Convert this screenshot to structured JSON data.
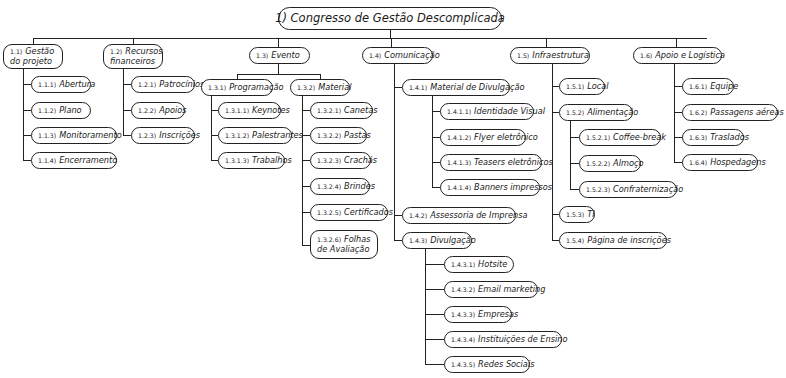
{
  "root": {
    "num": "1)",
    "label": "Congresso de Gestão Descomplicada"
  },
  "l1": [
    {
      "num": "1.1)",
      "label": "Gestão do projeto",
      "children": [
        {
          "num": "1.1.1)",
          "label": "Abertura"
        },
        {
          "num": "1.1.2)",
          "label": "Plano"
        },
        {
          "num": "1.1.3)",
          "label": "Monitoramento"
        },
        {
          "num": "1.1.4)",
          "label": "Encerramento"
        }
      ]
    },
    {
      "num": "1.2)",
      "label": "Recursos financeiros",
      "children": [
        {
          "num": "1.2.1)",
          "label": "Patrocínios"
        },
        {
          "num": "1.2.2)",
          "label": "Apoios"
        },
        {
          "num": "1.2.3)",
          "label": "Inscrições"
        }
      ]
    },
    {
      "num": "1.3)",
      "label": "Evento",
      "children": [
        {
          "num": "1.3.1)",
          "label": "Programação",
          "children": [
            {
              "num": "1.3.1.1)",
              "label": "Keynotes"
            },
            {
              "num": "1.3.1.2)",
              "label": "Palestrantes"
            },
            {
              "num": "1.3.1.3)",
              "label": "Trabalhos"
            }
          ]
        },
        {
          "num": "1.3.2)",
          "label": "Material",
          "children": [
            {
              "num": "1.3.2.1)",
              "label": "Canetas"
            },
            {
              "num": "1.3.2.2)",
              "label": "Pastas"
            },
            {
              "num": "1.3.2.3)",
              "label": "Crachás"
            },
            {
              "num": "1.3.2.4)",
              "label": "Brindes"
            },
            {
              "num": "1.3.2.5)",
              "label": "Certificados"
            },
            {
              "num": "1.3.2.6)",
              "label": "Folhas de Avaliação"
            }
          ]
        }
      ]
    },
    {
      "num": "1.4)",
      "label": "Comunicação",
      "children": [
        {
          "num": "1.4.1)",
          "label": "Material de Divulgação",
          "children": [
            {
              "num": "1.4.1.1)",
              "label": "Identidade Visual"
            },
            {
              "num": "1.4.1.2)",
              "label": "Flyer eletrônico"
            },
            {
              "num": "1.4.1.3)",
              "label": "Teasers eletrônicos"
            },
            {
              "num": "1.4.1.4)",
              "label": "Banners impressos"
            }
          ]
        },
        {
          "num": "1.4.2)",
          "label": "Assessoria de Imprensa"
        },
        {
          "num": "1.4.3)",
          "label": "Divulgação",
          "children": [
            {
              "num": "1.4.3.1)",
              "label": "Hotsite"
            },
            {
              "num": "1.4.3.2)",
              "label": "Email marketing"
            },
            {
              "num": "1.4.3.3)",
              "label": "Empresas"
            },
            {
              "num": "1.4.3.4)",
              "label": "Instituições de Ensino"
            },
            {
              "num": "1.4.3.5)",
              "label": "Redes Sociais"
            }
          ]
        }
      ]
    },
    {
      "num": "1.5)",
      "label": "Infraestrutura",
      "children": [
        {
          "num": "1.5.1)",
          "label": "Local"
        },
        {
          "num": "1.5.2)",
          "label": "Alimentação",
          "children": [
            {
              "num": "1.5.2.1)",
              "label": "Coffee-break"
            },
            {
              "num": "1.5.2.2)",
              "label": "Almoço"
            },
            {
              "num": "1.5.2.3)",
              "label": "Confraternização"
            }
          ]
        },
        {
          "num": "1.5.3)",
          "label": "TI"
        },
        {
          "num": "1.5.4)",
          "label": "Página de inscrições"
        }
      ]
    },
    {
      "num": "1.6)",
      "label": "Apoio e Logística",
      "children": [
        {
          "num": "1.6.1)",
          "label": "Equipe"
        },
        {
          "num": "1.6.2)",
          "label": "Passagens aéreas"
        },
        {
          "num": "1.6.3)",
          "label": "Traslados"
        },
        {
          "num": "1.6.4)",
          "label": "Hospedagens"
        }
      ]
    }
  ]
}
